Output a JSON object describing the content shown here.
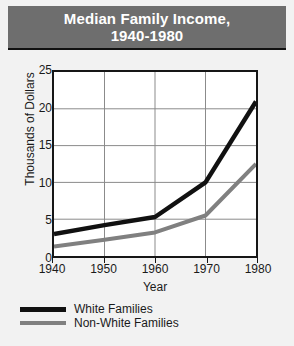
{
  "title": {
    "line1": "Median Family Income,",
    "line2": "1940-1980"
  },
  "colors": {
    "banner_bg": "#6e6e6e",
    "banner_text": "#ffffff",
    "page_bg": "#f2f2f2",
    "plot_bg": "#ffffff",
    "frame": "#161616",
    "grid": "#888888",
    "white_families_line": "#111111",
    "non_white_families_line": "#808080"
  },
  "legend": {
    "position": "below-plot",
    "items": [
      {
        "label": "White Families",
        "color": "#111111"
      },
      {
        "label": "Non-White Families",
        "color": "#808080"
      }
    ]
  },
  "chart_data": {
    "type": "line",
    "title": "Median Family Income, 1940-1980",
    "xlabel": "Year",
    "ylabel": "Thousands of Dollars",
    "x": [
      1940,
      1950,
      1960,
      1970,
      1980
    ],
    "xticklabels": [
      "1940",
      "1950",
      "1960",
      "1970",
      "1980"
    ],
    "xlim": [
      1940,
      1980
    ],
    "yticks": [
      0,
      5,
      10,
      15,
      20,
      25
    ],
    "yticklabels": [
      "0",
      "5",
      "10",
      "15",
      "20",
      "25"
    ],
    "ylim": [
      0,
      25
    ],
    "grid": true,
    "series": [
      {
        "name": "White Families",
        "color": "#111111",
        "values": [
          3.0,
          4.2,
          5.3,
          10.0,
          21.0
        ]
      },
      {
        "name": "Non-White Families",
        "color": "#808080",
        "values": [
          1.3,
          2.2,
          3.2,
          5.5,
          12.5
        ]
      }
    ]
  }
}
